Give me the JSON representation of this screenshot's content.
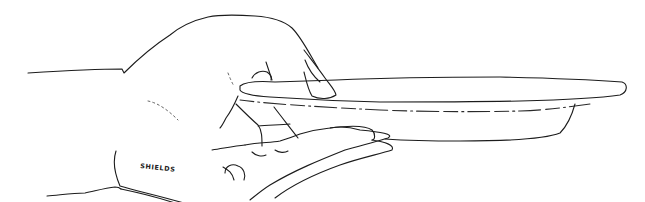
{
  "illustration": {
    "subject": "hand holding a plate",
    "style": "black ink line drawing",
    "signature": "SHIELDS",
    "colors": {
      "ink": "#1c1c1c",
      "background": "#ffffff"
    }
  }
}
